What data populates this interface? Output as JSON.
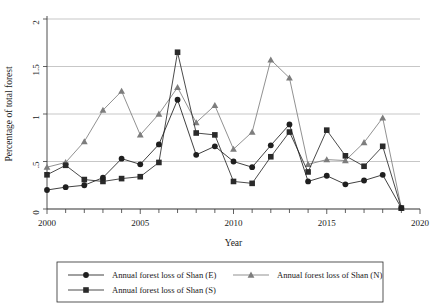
{
  "chart_data": {
    "type": "line",
    "title": "",
    "xlabel": "Year",
    "ylabel": "Percentage of total forest",
    "xlim": [
      2000,
      2020
    ],
    "ylim": [
      0,
      2
    ],
    "xticks": [
      2000,
      2005,
      2010,
      2015,
      2020
    ],
    "xtick_labels": [
      "2000",
      "2005",
      "2010",
      "2015",
      "2020"
    ],
    "yticks": [
      0,
      0.5,
      1,
      1.5,
      2
    ],
    "ytick_labels": [
      "0",
      ".5",
      "1",
      "1.5",
      "2"
    ],
    "grid": "horizontal",
    "legend_position": "bottom",
    "x": [
      2000,
      2001,
      2002,
      2003,
      2004,
      2005,
      2006,
      2007,
      2008,
      2009,
      2010,
      2011,
      2012,
      2013,
      2014,
      2015,
      2016,
      2017,
      2018,
      2019
    ],
    "series": [
      {
        "name": "Annual forest loss of Shan (E)",
        "marker": "circle",
        "color": "#1f1f1f",
        "values": [
          0.2,
          0.23,
          0.25,
          0.33,
          0.53,
          0.47,
          0.68,
          1.15,
          0.57,
          0.66,
          0.5,
          0.44,
          0.67,
          0.89,
          0.29,
          0.35,
          0.26,
          0.3,
          0.36,
          0.01
        ]
      },
      {
        "name": "Annual forest loss of Shan (N)",
        "marker": "triangle",
        "color": "#7d7d7d",
        "values": [
          0.44,
          0.49,
          0.71,
          1.04,
          1.24,
          0.78,
          1.0,
          1.28,
          0.91,
          1.09,
          0.63,
          0.81,
          1.57,
          1.38,
          0.47,
          0.52,
          0.51,
          0.7,
          0.96,
          0.01
        ]
      },
      {
        "name": "Annual forest loss of Shan (S)",
        "marker": "square",
        "color": "#2a2a2a",
        "values": [
          0.36,
          0.46,
          0.31,
          0.29,
          0.32,
          0.34,
          0.49,
          1.65,
          0.8,
          0.78,
          0.29,
          0.27,
          0.55,
          0.81,
          0.39,
          0.83,
          0.56,
          0.45,
          0.66,
          0.01
        ]
      }
    ]
  },
  "legend": {
    "entries": [
      {
        "label": "Annual forest loss of Shan (E)",
        "marker": "circle"
      },
      {
        "label": "Annual forest loss of Shan (N)",
        "marker": "triangle"
      },
      {
        "label": "Annual forest loss of Shan (S)",
        "marker": "square"
      }
    ]
  }
}
